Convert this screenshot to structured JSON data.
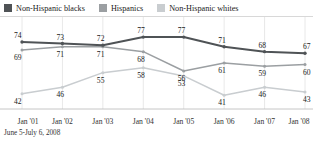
{
  "legend": {
    "items": [
      {
        "label": "Non-Hispanic blacks",
        "color": "#4f5356",
        "key": "blacks"
      },
      {
        "label": "Hispanics",
        "color": "#9b9fa2",
        "key": "hispanics"
      },
      {
        "label": "Non-Hispanic whites",
        "color": "#c9cdd0",
        "key": "whites"
      }
    ]
  },
  "footnote": "June 5-July 6, 2008",
  "chart_data": {
    "type": "line",
    "title": "",
    "subtitle": "",
    "xlabel": "",
    "ylabel": "",
    "grid": "vertical",
    "legend_position": "top-left",
    "categories": [
      "Jan '01",
      "Jan '02",
      "Jan '03",
      "Jan '04",
      "Jan '05",
      "Jan '06",
      "Jan '07",
      "Jan '08"
    ],
    "ylim": [
      35,
      82
    ],
    "series": [
      {
        "name": "Non-Hispanic blacks",
        "color": "#4f5356",
        "values": [
          74,
          73,
          72,
          77,
          77,
          71,
          68,
          67
        ],
        "label_position": "above"
      },
      {
        "name": "Hispanics",
        "color": "#9b9fa2",
        "values": [
          69,
          71,
          71,
          68,
          56,
          61,
          59,
          60
        ],
        "label_position": "below"
      },
      {
        "name": "Non-Hispanic whites",
        "color": "#c9cdd0",
        "values": [
          42,
          46,
          55,
          58,
          53,
          41,
          46,
          43
        ],
        "label_position": "below"
      }
    ]
  }
}
